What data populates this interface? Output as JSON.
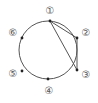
{
  "diagram": {
    "type": "circle-with-points",
    "circle": {
      "cx": 48,
      "cy": 50,
      "r": 29,
      "stroke": "#555555"
    },
    "points": [
      {
        "id": 1,
        "label": "①",
        "x": 50,
        "y": 21,
        "lx": 50,
        "ly": 11
      },
      {
        "id": 2,
        "label": "②",
        "x": 77,
        "y": 38,
        "lx": 86,
        "ly": 33
      },
      {
        "id": 3,
        "label": "③",
        "x": 77,
        "y": 70,
        "lx": 86,
        "ly": 75
      },
      {
        "id": 4,
        "label": "④",
        "x": 48,
        "y": 79,
        "lx": 49,
        "ly": 91
      },
      {
        "id": 5,
        "label": "⑤",
        "x": 22,
        "y": 71,
        "lx": 13,
        "ly": 74
      },
      {
        "id": 6,
        "label": "⑥",
        "x": 22,
        "y": 38,
        "lx": 13,
        "ly": 33
      }
    ],
    "chords": [
      {
        "from": 1,
        "to": 2
      },
      {
        "from": 2,
        "to": 3
      },
      {
        "from": 1,
        "to": 3
      }
    ]
  }
}
